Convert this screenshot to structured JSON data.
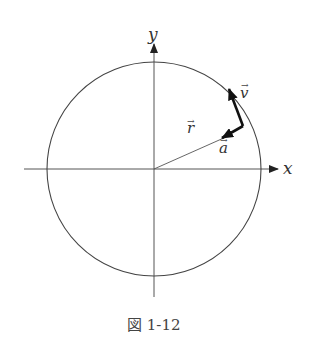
{
  "figure": {
    "caption": "図 1-12",
    "labels": {
      "x_axis": "x",
      "y_axis": "y",
      "r": "r",
      "v": "v",
      "a": "a",
      "vec_arrow": "→"
    },
    "colors": {
      "line": "#333333",
      "axis": "#444444",
      "background": "#ffffff"
    },
    "elements": [
      "x-axis",
      "y-axis",
      "circle",
      "position-vector-r",
      "velocity-vector-v",
      "acceleration-vector-a"
    ]
  }
}
